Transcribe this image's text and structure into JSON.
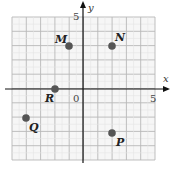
{
  "axes": {
    "x_label": "x",
    "y_label": "y",
    "x_tick_label": "5",
    "y_tick_label": "5",
    "origin_label": "0",
    "range": {
      "xmin": -5,
      "xmax": 5,
      "ymin": -5,
      "ymax": 5
    }
  },
  "points": [
    {
      "label": "M",
      "x": -1,
      "y": 3
    },
    {
      "label": "N",
      "x": 2,
      "y": 3
    },
    {
      "label": "R",
      "x": -2,
      "y": 0
    },
    {
      "label": "Q",
      "x": -4,
      "y": -2
    },
    {
      "label": "P",
      "x": 2,
      "y": -3
    }
  ],
  "colors": {
    "point": "#555555",
    "grid": "#bbbbbb",
    "axis": "#111111"
  }
}
